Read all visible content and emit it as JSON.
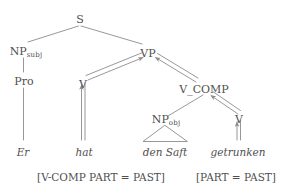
{
  "figure": {
    "kind": "syntax-tree-diagram",
    "line_color": "#8c8c8c",
    "text_color": "#4f4f4f",
    "background_color": "#ffffff"
  },
  "nodes": {
    "s": {
      "label": "S"
    },
    "np_subj": {
      "label": "NP",
      "subscript": "subj"
    },
    "vp": {
      "label": "VP"
    },
    "pro": {
      "label": "Pro"
    },
    "v_left": {
      "label": "V"
    },
    "v_comp": {
      "label": "V_COMP"
    },
    "np_obj": {
      "label": "NP",
      "subscript": "obj"
    },
    "v_right": {
      "label": "V"
    }
  },
  "leaves": {
    "er": {
      "label": "Er"
    },
    "hat": {
      "label": "hat"
    },
    "den_saft": {
      "label": "den Saft"
    },
    "getrunken": {
      "label": "getrunken"
    }
  },
  "features": {
    "left": {
      "label": "[V-COMP PART = PAST]"
    },
    "right": {
      "label": "[PART = PAST]"
    }
  }
}
